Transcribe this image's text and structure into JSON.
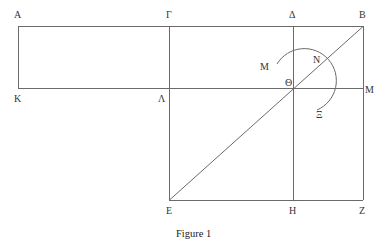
{
  "figure": {
    "caption": "Figure 1",
    "line_color": "#6a6a6a",
    "label_color": "#333333"
  },
  "points": {
    "A": {
      "label": "A",
      "x": 18,
      "y": 26
    },
    "Gamma": {
      "label": "Γ",
      "x": 169,
      "y": 26
    },
    "Delta": {
      "label": "Δ",
      "x": 293,
      "y": 26
    },
    "B": {
      "label": "B",
      "x": 363,
      "y": 26
    },
    "K": {
      "label": "K",
      "x": 18,
      "y": 88
    },
    "Lambda": {
      "label": "Λ",
      "x": 169,
      "y": 88
    },
    "Theta": {
      "label": "Θ",
      "x": 293,
      "y": 88
    },
    "M_right": {
      "label": "M",
      "x": 363,
      "y": 88
    },
    "E": {
      "label": "E",
      "x": 169,
      "y": 200
    },
    "H": {
      "label": "H",
      "x": 293,
      "y": 200
    },
    "Z": {
      "label": "Z",
      "x": 363,
      "y": 200
    },
    "M_arc": {
      "label": "M",
      "x": 275,
      "y": 65
    },
    "N": {
      "label": "N",
      "x": 315,
      "y": 66
    },
    "Xi": {
      "label": "Ξ",
      "x": 322,
      "y": 113
    }
  },
  "arc": {
    "center": "Theta",
    "radius": 32,
    "from_label": "M",
    "through_label": "N",
    "to_label": "Ξ"
  }
}
